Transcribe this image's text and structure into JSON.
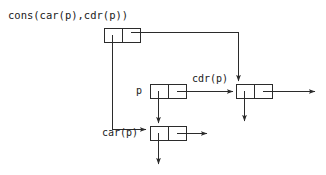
{
  "diagram": {
    "kind": "cons-cell-box-and-pointer-diagram",
    "stroke_color": "#2b2b2b",
    "background_color": "#ffffff",
    "labels": {
      "cons_expression": "cons(car(p),cdr(p))",
      "p": "p",
      "car_p": "car(p)",
      "cdr_p": "cdr(p)"
    },
    "cells": [
      {
        "id": "cons-cell",
        "label": "cons(car(p),cdr(p))",
        "x": 104,
        "y": 28,
        "width": 36,
        "height": 14,
        "divider_x": 122
      },
      {
        "id": "p-cell",
        "label": "p",
        "x": 150,
        "y": 84,
        "width": 36,
        "height": 14,
        "divider_x": 168
      },
      {
        "id": "car-cell",
        "label": "car(p)",
        "x": 150,
        "y": 126,
        "width": 36,
        "height": 14,
        "divider_x": 168
      },
      {
        "id": "cdr-cell",
        "label": "cdr(p)",
        "x": 236,
        "y": 84,
        "width": 36,
        "height": 14,
        "divider_x": 254
      }
    ],
    "pointers": [
      {
        "id": "cons-car-pointer",
        "from": "cons-cell.car",
        "to": "car-cell.top",
        "style": "down-then-right"
      },
      {
        "id": "cons-cdr-pointer",
        "from": "cons-cell.cdr",
        "to": "cdr-cell.top",
        "style": "right-then-down"
      },
      {
        "id": "p-car-pointer",
        "from": "p-cell.car",
        "to": "car-cell.top",
        "style": "down"
      },
      {
        "id": "p-cdr-pointer",
        "from": "p-cell.cdr",
        "to": "cdr-cell.left",
        "style": "right"
      },
      {
        "id": "car-cell-car-out",
        "from": "car-cell.car",
        "to": "below",
        "style": "down"
      },
      {
        "id": "car-cell-cdr-out",
        "from": "car-cell.cdr",
        "to": "right",
        "style": "right"
      },
      {
        "id": "cdr-cell-car-out",
        "from": "cdr-cell.car",
        "to": "below",
        "style": "down"
      },
      {
        "id": "cdr-cell-cdr-out",
        "from": "cdr-cell.cdr",
        "to": "right",
        "style": "right"
      }
    ]
  }
}
